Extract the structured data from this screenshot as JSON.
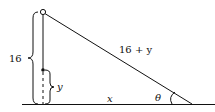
{
  "diagram": {
    "labels": {
      "height": "16",
      "hypotenuse": "16 + y",
      "segment": "y",
      "base": "x",
      "angle": "θ"
    },
    "colors": {
      "line": "#111111",
      "background": "#ffffff"
    }
  }
}
